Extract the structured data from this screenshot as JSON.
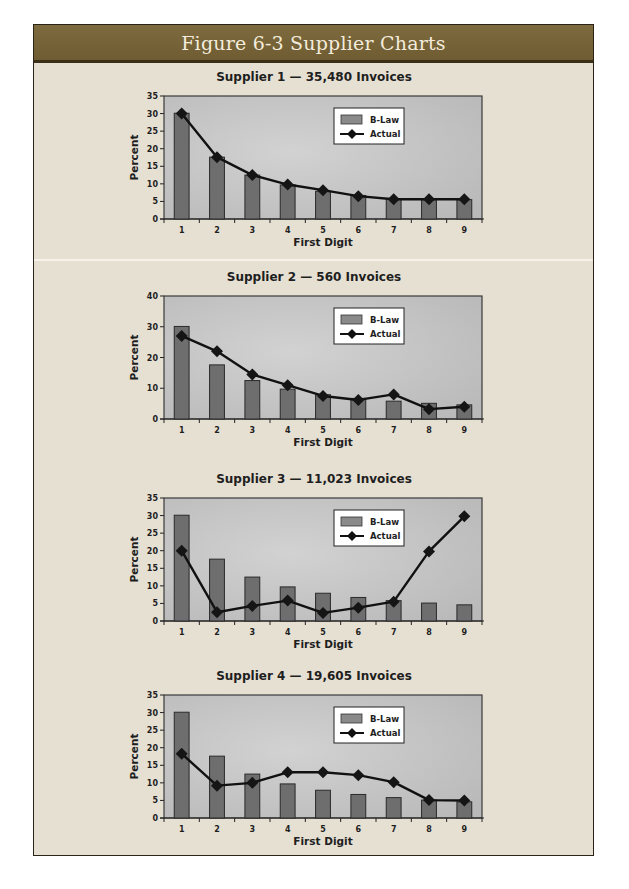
{
  "header": {
    "title": "Figure 6-3 Supplier Charts"
  },
  "colors": {
    "header_bg": "#75633a",
    "frame_bg": "#e6e0d3",
    "plot_bg": "#c4c4c4",
    "bar_fill": "#6e6e6e",
    "line": "#111111"
  },
  "legend": {
    "bar_label": "B-Law",
    "line_label": "Actual"
  },
  "chart_data": [
    {
      "type": "bar",
      "title": "Supplier 1 — 35,480 Invoices",
      "xlabel": "First Digit",
      "ylabel": "Percent",
      "ylim": [
        0,
        35
      ],
      "yticks": [
        0,
        5,
        10,
        15,
        20,
        25,
        30,
        35
      ],
      "categories": [
        "1",
        "2",
        "3",
        "4",
        "5",
        "6",
        "7",
        "8",
        "9"
      ],
      "series": [
        {
          "name": "B-Law",
          "kind": "bar",
          "values": [
            30.1,
            17.6,
            12.5,
            9.7,
            7.9,
            6.7,
            5.8,
            5.5,
            5.5
          ]
        },
        {
          "name": "Actual",
          "kind": "line",
          "values": [
            30,
            17.6,
            12.5,
            9.8,
            8.2,
            6.5,
            5.6,
            5.6,
            5.6
          ]
        }
      ],
      "legend_position": "upper-right"
    },
    {
      "type": "bar",
      "title": "Supplier 2 — 560 Invoices",
      "xlabel": "First Digit",
      "ylabel": "Percent",
      "ylim": [
        0,
        40
      ],
      "yticks": [
        0,
        10,
        20,
        30,
        40
      ],
      "categories": [
        "1",
        "2",
        "3",
        "4",
        "5",
        "6",
        "7",
        "8",
        "9"
      ],
      "series": [
        {
          "name": "B-Law",
          "kind": "bar",
          "values": [
            30.1,
            17.6,
            12.5,
            9.7,
            7.9,
            6.7,
            5.8,
            5.1,
            4.6
          ]
        },
        {
          "name": "Actual",
          "kind": "line",
          "values": [
            27,
            22,
            14.5,
            11,
            7.5,
            6.2,
            8,
            3.2,
            4
          ]
        }
      ],
      "legend_position": "upper-right"
    },
    {
      "type": "bar",
      "title": "Supplier 3 — 11,023 Invoices",
      "xlabel": "First Digit",
      "ylabel": "Percent",
      "ylim": [
        0,
        35
      ],
      "yticks": [
        0,
        5,
        10,
        15,
        20,
        25,
        30,
        35
      ],
      "categories": [
        "1",
        "2",
        "3",
        "4",
        "5",
        "6",
        "7",
        "8",
        "9"
      ],
      "series": [
        {
          "name": "B-Law",
          "kind": "bar",
          "values": [
            30.1,
            17.6,
            12.5,
            9.7,
            7.9,
            6.7,
            5.8,
            5.1,
            4.6
          ]
        },
        {
          "name": "Actual",
          "kind": "line",
          "values": [
            20,
            2.5,
            4.3,
            5.8,
            2.3,
            3.8,
            5.5,
            19.8,
            29.8
          ]
        }
      ],
      "legend_position": "upper-right"
    },
    {
      "type": "bar",
      "title": "Supplier 4 — 19,605 Invoices",
      "xlabel": "First Digit",
      "ylabel": "Percent",
      "ylim": [
        0,
        35
      ],
      "yticks": [
        0,
        5,
        10,
        15,
        20,
        25,
        30,
        35
      ],
      "categories": [
        "1",
        "2",
        "3",
        "4",
        "5",
        "6",
        "7",
        "8",
        "9"
      ],
      "series": [
        {
          "name": "B-Law",
          "kind": "bar",
          "values": [
            30.1,
            17.6,
            12.5,
            9.7,
            7.9,
            6.7,
            5.8,
            5.1,
            4.6
          ]
        },
        {
          "name": "Actual",
          "kind": "line",
          "values": [
            18.3,
            9.2,
            10,
            13,
            13,
            12.2,
            10.2,
            5.1,
            5
          ]
        }
      ],
      "legend_position": "upper-right"
    }
  ]
}
